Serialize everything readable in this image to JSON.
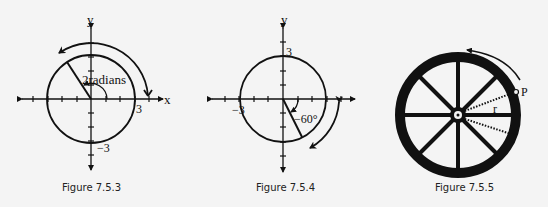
{
  "figures": [
    {
      "caption": "Figure 7.5.3",
      "x_axis_label": "x",
      "y_axis_label": "y",
      "radius_label": "3",
      "neg_label": "−3",
      "angle_label": "2 radians",
      "angle_text": "2radians"
    },
    {
      "caption": "Figure 7.5.4",
      "x_axis_label": "x",
      "y_axis_label": "y",
      "pos_label": "3",
      "neg_label": "−3",
      "angle_label": "−60°"
    },
    {
      "caption": "Figure 7.5.5",
      "point_label": "P",
      "radius_label": "r"
    }
  ],
  "colors": {
    "ink": "#111111",
    "background": "#f4f4f4"
  }
}
